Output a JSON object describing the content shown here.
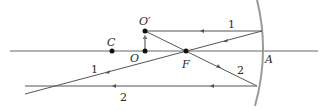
{
  "diagram": {
    "type": "concave-mirror-ray-diagram",
    "colors": {
      "ray": "#555555",
      "axis": "#666666",
      "mirror": "#9a9a9a",
      "point": "#111111",
      "object_arrow": "#666666"
    },
    "points": {
      "C": {
        "label": "C",
        "x": 112,
        "y": 51
      },
      "O": {
        "label": "O",
        "x": 145,
        "y": 51
      },
      "O_prime": {
        "label": "O′",
        "x": 145,
        "y": 31
      },
      "F": {
        "label": "F",
        "x": 186,
        "y": 51
      },
      "A": {
        "label": "A"
      }
    },
    "rays": [
      {
        "id": "1",
        "label_top": "1",
        "label_bottom": "1"
      },
      {
        "id": "2",
        "label_top": "2",
        "label_bottom": "2"
      }
    ]
  }
}
